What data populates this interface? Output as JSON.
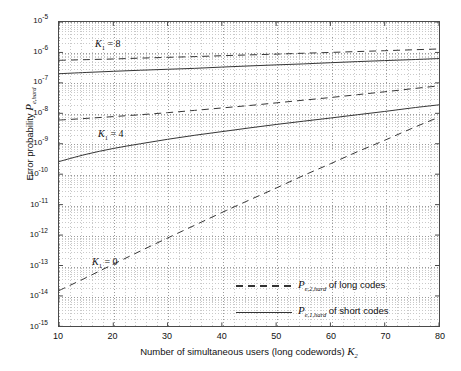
{
  "chart_data": {
    "type": "line",
    "title": "",
    "xlabel": "Number of simultaneous users  (long codewords)   K_2",
    "ylabel": "Error probability   P_e,hard",
    "xlim": [
      10,
      80
    ],
    "ylim": [
      1e-15,
      1e-05
    ],
    "yscale": "log",
    "xscale": "linear",
    "grid": true,
    "legend_position": "lower-right",
    "xticks": [
      "10",
      "20",
      "30",
      "40",
      "50",
      "60",
      "70",
      "80"
    ],
    "yticks": [
      "10-5",
      "10-6",
      "10-7",
      "10-8",
      "10-9",
      "10-10",
      "10-11",
      "10-12",
      "10-13",
      "10-14",
      "10-15"
    ],
    "ytick_exponents": [
      -5,
      -6,
      -7,
      -8,
      -9,
      -10,
      -11,
      -12,
      -13,
      -14,
      -15
    ],
    "annotations": [
      {
        "text": "K_1 = 8",
        "x": 26,
        "y": 2.2e-06
      },
      {
        "text": "K_1 = 4",
        "x": 27,
        "y": 3e-09
      },
      {
        "text": "K_1 = 0",
        "x": 25,
        "y": 6e-13
      }
    ],
    "series": [
      {
        "name": "P_e,2,hard of long codes  (K_1 = 8)",
        "style": "dashed",
        "group": "K1=8",
        "x": [
          10,
          15,
          20,
          25,
          30,
          35,
          40,
          45,
          50,
          55,
          60,
          65,
          70,
          75,
          80
        ],
        "y": [
          5.5e-07,
          5.8e-07,
          6.1e-07,
          6.5e-07,
          6.9e-07,
          7.3e-07,
          7.8e-07,
          8.3e-07,
          8.8e-07,
          9.4e-07,
          1e-06,
          1.07e-06,
          1.14e-06,
          1.22e-06,
          1.3e-06
        ]
      },
      {
        "name": "P_e,1,hard of short codes  (K_1 = 8)",
        "style": "solid",
        "group": "K1=8",
        "x": [
          10,
          15,
          20,
          25,
          30,
          35,
          40,
          45,
          50,
          55,
          60,
          65,
          70,
          75,
          80
        ],
        "y": [
          2e-07,
          2.2e-07,
          2.4e-07,
          2.6e-07,
          2.8e-07,
          3e-07,
          3.3e-07,
          3.6e-07,
          3.9e-07,
          4.2e-07,
          4.6e-07,
          5e-07,
          5.4e-07,
          5.8e-07,
          6.3e-07
        ]
      },
      {
        "name": "P_e,2,hard of long codes  (K_1 = 4)",
        "style": "dashed",
        "group": "K1=4",
        "x": [
          10,
          15,
          20,
          25,
          30,
          35,
          40,
          45,
          50,
          55,
          60,
          65,
          70,
          75,
          80
        ],
        "y": [
          6e-09,
          6.8e-09,
          7.8e-09,
          9e-09,
          1.05e-08,
          1.25e-08,
          1.5e-08,
          1.8e-08,
          2.2e-08,
          2.7e-08,
          3.3e-08,
          4.1e-08,
          5.1e-08,
          6.4e-08,
          8e-08
        ]
      },
      {
        "name": "P_e,1,hard of short codes  (K_1 = 4)",
        "style": "solid",
        "group": "K1=4",
        "x": [
          10,
          15,
          20,
          25,
          30,
          35,
          40,
          45,
          50,
          55,
          60,
          65,
          70,
          75,
          80
        ],
        "y": [
          2.6e-10,
          4.5e-10,
          7e-10,
          1e-09,
          1.4e-09,
          1.9e-09,
          2.5e-09,
          3.3e-09,
          4.3e-09,
          5.5e-09,
          7e-09,
          9e-09,
          1.15e-08,
          1.5e-08,
          1.9e-08
        ]
      },
      {
        "name": "P_e,2,hard of long codes  (K_1 = 0)",
        "style": "dashed",
        "group": "K1=0",
        "x": [
          10,
          15,
          20,
          25,
          30,
          35,
          40,
          45,
          50,
          55,
          60,
          65,
          70,
          75,
          80
        ],
        "y": [
          1.5e-14,
          4e-14,
          1.1e-13,
          3e-13,
          8e-13,
          2.1e-12,
          5.5e-12,
          1.4e-11,
          3.5e-11,
          9e-11,
          2.2e-10,
          5.5e-10,
          1.3e-09,
          3.2e-09,
          7.5e-09
        ]
      }
    ],
    "legend": [
      {
        "label": "P",
        "sub": "e,2,hard",
        "suffix": " of long codes",
        "style": "dashed"
      },
      {
        "label": "P",
        "sub": "e,1,hard",
        "suffix": " of short codes",
        "style": "solid"
      }
    ]
  },
  "axis": {
    "y_title_prefix": "Error probability   ",
    "y_title_sym": "P",
    "y_title_sub": "e,hard",
    "x_title_main": "Number of simultaneous users  (long codewords)   ",
    "x_title_sym": "K",
    "x_title_sub": "2"
  },
  "annotations": {
    "k1_8": {
      "sym": "K",
      "sub": "1",
      "eq": " = 8"
    },
    "k1_4": {
      "sym": "K",
      "sub": "1",
      "eq": " = 4"
    },
    "k1_0": {
      "sym": "K",
      "sub": "1",
      "eq": " = 0"
    }
  },
  "colors": {
    "curve": "#333333",
    "grid_major": "#9a9a9a",
    "grid_minor": "#c9c9c9",
    "frame": "#4a4a4a",
    "text": "#111111"
  }
}
